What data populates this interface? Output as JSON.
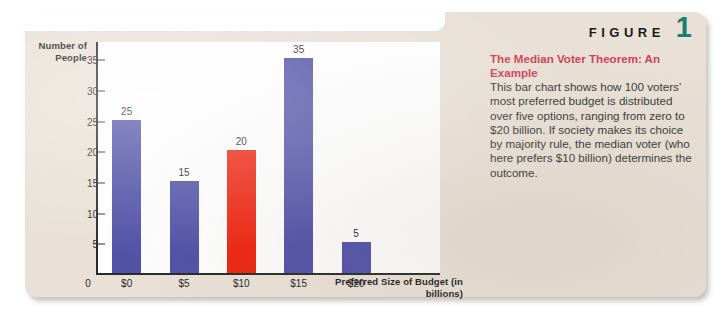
{
  "figure": {
    "label_word": "FIGURE",
    "number": "1",
    "title": "The Median Voter Theorem: An Example",
    "body": "This bar chart shows how 100 voters’ most preferred budget is distributed over five options, ranging from zero to $20 billion. If society makes its choice by majority rule, the median voter (who here prefers $10 billion) determines the outcome.",
    "accent_title_color": "#cf4356",
    "accent_number_color": "#1c7f6e",
    "card_color": "#e9e1d7"
  },
  "chart_data": {
    "type": "bar",
    "title": "",
    "xlabel": "Preferred Size of Budget (in billions)",
    "ylabel": "Number of People",
    "categories": [
      "$0",
      "$5",
      "$10",
      "$15",
      "$20"
    ],
    "values": [
      25,
      15,
      20,
      35,
      5
    ],
    "data_labels": [
      "25",
      "15",
      "20",
      "35",
      "5"
    ],
    "bar_colors": [
      "#5252a8",
      "#5252a8",
      "#ee2612",
      "#5252a8",
      "#5252a8"
    ],
    "highlight_index": 2,
    "ylim": [
      0,
      38
    ],
    "yticks": [
      0,
      5,
      10,
      15,
      20,
      25,
      30,
      35
    ],
    "ytick_labels": [
      "0",
      "5",
      "10",
      "15",
      "20",
      "25",
      "30",
      "35"
    ],
    "grid": false,
    "legend": null,
    "origin_label": "0"
  }
}
